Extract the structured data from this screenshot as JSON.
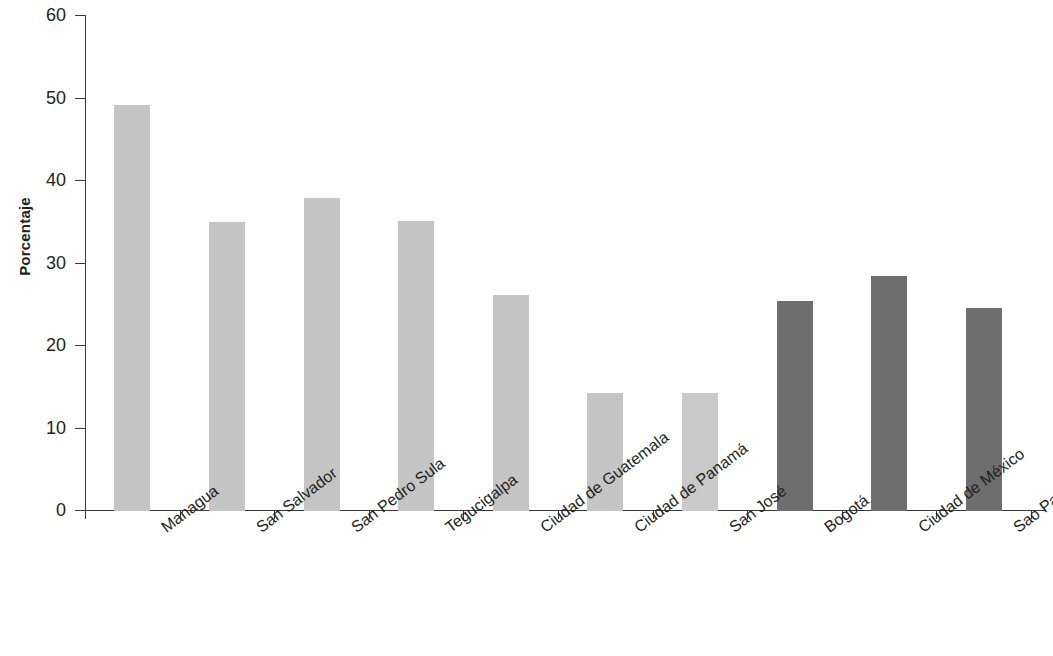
{
  "chart_data": {
    "type": "bar",
    "title": "",
    "subtitle": "",
    "xlabel": "",
    "ylabel": "Porcentaje",
    "ylim": [
      0,
      60
    ],
    "ytick_labels": [
      "0",
      "10",
      "20",
      "30",
      "40",
      "50",
      "60"
    ],
    "ytick_values": [
      0,
      10,
      20,
      30,
      40,
      50,
      60
    ],
    "grid": false,
    "legend": "none",
    "categories": [
      "Managua",
      "San Salvador",
      "San Pedro Sula",
      "Tegucigalpa",
      "Ciudad de Guatemala",
      "Ciudad de Panamá",
      "San José",
      "Bogotá",
      "Ciudad de México",
      "Sao Paulo"
    ],
    "values": [
      49.2,
      35.0,
      38.0,
      35.1,
      26.2,
      14.3,
      14.3,
      25.4,
      28.5,
      24.6
    ],
    "bar_colors": [
      "#c5c5c5",
      "#c5c5c5",
      "#c5c5c5",
      "#c5c5c5",
      "#c5c5c5",
      "#c5c5c5",
      "#c9c9c9",
      "#6e6e6e",
      "#6e6e6e",
      "#6e6e6e"
    ],
    "series": [
      {
        "name": "Porcentaje",
        "values": [
          49.2,
          35.0,
          38.0,
          35.1,
          26.2,
          14.3,
          14.3,
          25.4,
          28.5,
          24.6
        ]
      }
    ],
    "colors": {
      "light_bar": "#c5c5c5",
      "dark_bar": "#6e6e6e",
      "axis": "#3a3a3a",
      "text": "#231f20",
      "background": "#ffffff"
    }
  }
}
